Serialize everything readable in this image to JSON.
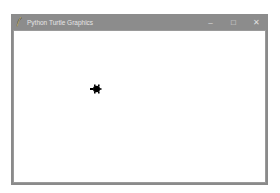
{
  "window": {
    "title": "Python Turtle Graphics",
    "controls": {
      "minimize": "–",
      "maximize": "□",
      "close": "✕"
    }
  },
  "canvas": {
    "background": "#ffffff",
    "turtle": {
      "shape": "turtle",
      "color": "#000000",
      "heading": "east"
    }
  }
}
